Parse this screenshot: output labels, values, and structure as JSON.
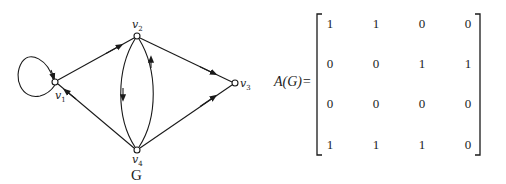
{
  "graph": {
    "name": "G",
    "vertices": [
      {
        "id": "v1",
        "label": "v",
        "sub": "1",
        "x": 55,
        "y": 82
      },
      {
        "id": "v2",
        "label": "v",
        "sub": "2",
        "x": 137,
        "y": 36
      },
      {
        "id": "v3",
        "label": "v",
        "sub": "3",
        "x": 235,
        "y": 83
      },
      {
        "id": "v4",
        "label": "v",
        "sub": "4",
        "x": 137,
        "y": 150
      }
    ],
    "edges": [
      {
        "from": "v1",
        "to": "v1",
        "type": "loop"
      },
      {
        "from": "v1",
        "to": "v2"
      },
      {
        "from": "v2",
        "to": "v3"
      },
      {
        "from": "v2",
        "to": "v4"
      },
      {
        "from": "v4",
        "to": "v1"
      },
      {
        "from": "v4",
        "to": "v2"
      },
      {
        "from": "v4",
        "to": "v3"
      }
    ]
  },
  "matrix": {
    "label": "A(G)=",
    "rows": [
      [
        "1",
        "1",
        "0",
        "0"
      ],
      [
        "0",
        "0",
        "1",
        "1"
      ],
      [
        "0",
        "0",
        "0",
        "0"
      ],
      [
        "1",
        "1",
        "1",
        "0"
      ]
    ]
  }
}
